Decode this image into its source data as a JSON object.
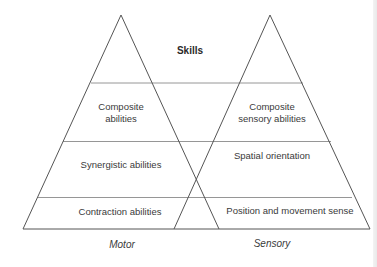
{
  "diagram": {
    "title": "Skills",
    "pyramids": [
      {
        "name": "Motor",
        "levels": [
          {
            "label_line1": "Composite",
            "label_line2": "abilities"
          },
          {
            "label_line1": "Synergistic abilities"
          },
          {
            "label_line1": "Contraction abilities"
          }
        ]
      },
      {
        "name": "Sensory",
        "levels": [
          {
            "label_line1": "Composite",
            "label_line2": "sensory abilities"
          },
          {
            "label_line1": "Spatial orientation"
          },
          {
            "label_line1": "Position and movement sense"
          }
        ]
      }
    ],
    "colors": {
      "triangle_edge": "#555555",
      "divider_line": "#8a8a8a",
      "base_line": "#555555",
      "text": "#3a3a3a"
    }
  }
}
